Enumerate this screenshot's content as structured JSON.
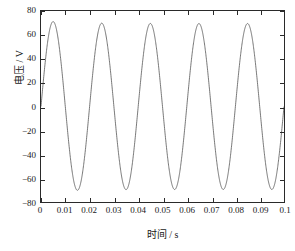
{
  "chart_data": {
    "type": "line",
    "title": "",
    "subtitle": "",
    "xlabel": "时间 / s",
    "ylabel": "电压 / V",
    "xlim": [
      0,
      0.1
    ],
    "ylim": [
      -80,
      80
    ],
    "xticks": [
      0,
      0.01,
      0.02,
      0.03,
      0.04,
      0.05,
      0.06,
      0.07,
      0.08,
      0.09,
      0.1
    ],
    "xtick_labels": [
      "0",
      "0.01",
      "0.02",
      "0.03",
      "0.04",
      "0.05",
      "0.06",
      "0.07",
      "0.08",
      "0.09",
      "0.1"
    ],
    "yticks": [
      80,
      60,
      40,
      20,
      0,
      -20,
      -40,
      -60,
      -80
    ],
    "ytick_labels": [
      "80",
      "60",
      "40",
      "20",
      "0",
      "−20",
      "−40",
      "−60",
      "−80"
    ],
    "grid": false,
    "legend": null,
    "annotations": [],
    "line_color": "#555555",
    "line_width": 0.8,
    "series": [
      {
        "name": "电压",
        "description": "50 Hz sinusoidal voltage waveform, amplitude approx 70 V, starting at 0 V with a small initial overshoot on the first cycle",
        "waveform": {
          "shape": "sine",
          "frequency_hz": 50,
          "period_s": 0.02,
          "amplitude_v": 70,
          "first_peak_v": 72,
          "steady_peak_v": 69.5,
          "steady_trough_v": -70,
          "phase_rad": 0,
          "offset_v": 0,
          "cycles_shown": 5,
          "start_value_v": 0,
          "end_value_v": -66
        },
        "peaks": [
          {
            "t": 0.0075,
            "v": 72
          },
          {
            "t": 0.0277,
            "v": 69.5
          },
          {
            "t": 0.0477,
            "v": 69.5
          },
          {
            "t": 0.0677,
            "v": 69.5
          },
          {
            "t": 0.0877,
            "v": 69.5
          }
        ],
        "troughs": [
          {
            "t": 0.0178,
            "v": -70
          },
          {
            "t": 0.0378,
            "v": -70
          },
          {
            "t": 0.0577,
            "v": -70
          },
          {
            "t": 0.0777,
            "v": -70
          },
          {
            "t": 0.0977,
            "v": -70
          }
        ],
        "zero_crossings": [
          0,
          0.0128,
          0.0228,
          0.0328,
          0.0428,
          0.0528,
          0.0628,
          0.0728,
          0.0828,
          0.0928
        ]
      }
    ]
  },
  "axes": {
    "frame_color": "#2a2a2a",
    "background": "#ffffff",
    "tick_direction": "in"
  }
}
